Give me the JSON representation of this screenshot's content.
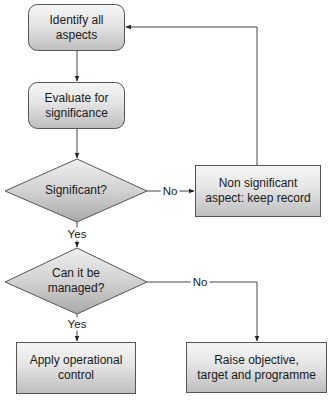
{
  "diagram": {
    "type": "flowchart",
    "nodes": {
      "identify": {
        "label": "Identify all aspects",
        "line1": "Identify all",
        "line2": "aspects",
        "shape": "rounded-rect"
      },
      "evaluate": {
        "label": "Evaluate for significance",
        "line1": "Evaluate for",
        "line2": "significance",
        "shape": "rounded-rect"
      },
      "significant": {
        "label": "Significant?",
        "line1": "Significant?",
        "shape": "diamond"
      },
      "non_significant": {
        "label": "Non significant aspect: keep record",
        "line1": "Non significant",
        "line2": "aspect: keep record",
        "shape": "rect"
      },
      "managed": {
        "label": "Can it be managed?",
        "line1": "Can it be",
        "line2": "managed?",
        "shape": "diamond"
      },
      "apply": {
        "label": "Apply operational control",
        "line1": "Apply operational",
        "line2": "control",
        "shape": "rect"
      },
      "raise": {
        "label": "Raise objective, target and programme",
        "line1": "Raise objective,",
        "line2": "target and programme",
        "shape": "rect"
      }
    },
    "edges": {
      "identify_to_evaluate": {
        "from": "identify",
        "to": "evaluate",
        "label": ""
      },
      "evaluate_to_significant": {
        "from": "evaluate",
        "to": "significant",
        "label": ""
      },
      "significant_no": {
        "from": "significant",
        "to": "non_significant",
        "label": "No"
      },
      "non_significant_loop": {
        "from": "non_significant",
        "to": "identify",
        "label": ""
      },
      "significant_yes": {
        "from": "significant",
        "to": "managed",
        "label": "Yes"
      },
      "managed_yes": {
        "from": "managed",
        "to": "apply",
        "label": "Yes"
      },
      "managed_no": {
        "from": "managed",
        "to": "raise",
        "label": "No"
      }
    },
    "colors": {
      "fill_top": "#f6f6f6",
      "fill_bottom": "#bdbdbd",
      "diamond_top": "#eeeeee",
      "diamond_bottom": "#a9a9a9",
      "stroke": "#555555",
      "line": "#444444"
    }
  }
}
